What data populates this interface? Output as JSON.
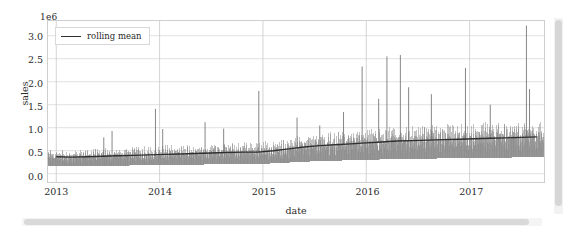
{
  "chart_data": {
    "type": "line",
    "title": "",
    "xlabel": "date",
    "ylabel": "sales",
    "y_offset_text": "1e6",
    "grid": true,
    "legend_position": "upper left",
    "xlim": [
      2012.92,
      2017.72
    ],
    "ylim": [
      -0.18,
      3.32
    ],
    "yticks": [
      "0.0",
      "0.5",
      "1.0",
      "1.5",
      "2.0",
      "2.5",
      "3.0"
    ],
    "ytick_values": [
      0.0,
      0.5,
      1.0,
      1.5,
      2.0,
      2.5,
      3.0
    ],
    "xticks": [
      "2013",
      "2014",
      "2015",
      "2016",
      "2017"
    ],
    "xtick_values": [
      2013,
      2014,
      2015,
      2016,
      2017
    ],
    "series": [
      {
        "name": "daily sales",
        "color": "#8a8a8a",
        "in_legend": false,
        "note": "noisy daily observations with holiday spikes",
        "spikes": [
          {
            "x": 2013.46,
            "y": 0.79
          },
          {
            "x": 2013.54,
            "y": 0.93
          },
          {
            "x": 2013.96,
            "y": 1.41
          },
          {
            "x": 2014.03,
            "y": 0.97
          },
          {
            "x": 2014.44,
            "y": 1.12
          },
          {
            "x": 2014.62,
            "y": 0.98
          },
          {
            "x": 2014.96,
            "y": 1.8
          },
          {
            "x": 2015.33,
            "y": 1.22
          },
          {
            "x": 2015.55,
            "y": 1.05
          },
          {
            "x": 2015.78,
            "y": 1.34
          },
          {
            "x": 2015.96,
            "y": 2.33
          },
          {
            "x": 2016.12,
            "y": 1.63
          },
          {
            "x": 2016.2,
            "y": 2.55
          },
          {
            "x": 2016.33,
            "y": 2.58
          },
          {
            "x": 2016.41,
            "y": 1.88
          },
          {
            "x": 2016.63,
            "y": 1.73
          },
          {
            "x": 2016.96,
            "y": 2.3
          },
          {
            "x": 2017.2,
            "y": 1.5
          },
          {
            "x": 2017.55,
            "y": 3.22
          },
          {
            "x": 2017.58,
            "y": 1.84
          }
        ]
      },
      {
        "name": "rolling mean",
        "color": "#2f2f2f",
        "in_legend": true,
        "x": [
          2013.0,
          2013.15,
          2013.3,
          2013.45,
          2013.6,
          2013.75,
          2013.9,
          2014.05,
          2014.2,
          2014.35,
          2014.5,
          2014.65,
          2014.8,
          2014.95,
          2015.1,
          2015.25,
          2015.4,
          2015.55,
          2015.7,
          2015.85,
          2016.0,
          2016.15,
          2016.3,
          2016.45,
          2016.6,
          2016.75,
          2016.9,
          2017.05,
          2017.2,
          2017.35,
          2017.5,
          2017.65
        ],
        "y": [
          0.37,
          0.36,
          0.37,
          0.38,
          0.39,
          0.4,
          0.41,
          0.42,
          0.43,
          0.44,
          0.45,
          0.46,
          0.47,
          0.47,
          0.5,
          0.54,
          0.58,
          0.61,
          0.63,
          0.65,
          0.67,
          0.69,
          0.71,
          0.72,
          0.73,
          0.74,
          0.75,
          0.76,
          0.77,
          0.78,
          0.79,
          0.8
        ]
      }
    ],
    "legend_entries": [
      {
        "label": "rolling mean",
        "color": "#2f2f2f",
        "marker": "line"
      }
    ]
  },
  "scrollbars": {
    "vertical_present": true,
    "horizontal_present": true
  }
}
